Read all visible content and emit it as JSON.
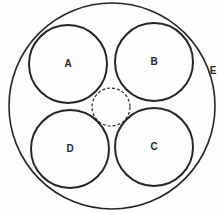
{
  "diagram": {
    "outer": {
      "label": "E",
      "cx": 112,
      "cy": 106,
      "r": 103,
      "label_x": 213,
      "label_y": 71
    },
    "circles": [
      {
        "label": "A",
        "cx": 68,
        "cy": 64,
        "r": 39
      },
      {
        "label": "B",
        "cx": 154,
        "cy": 62,
        "r": 39
      },
      {
        "label": "C",
        "cx": 154,
        "cy": 147,
        "r": 39
      },
      {
        "label": "D",
        "cx": 70,
        "cy": 149,
        "r": 39
      }
    ],
    "center_dashed": {
      "cx": 111,
      "cy": 107,
      "r": 19
    },
    "stroke_color": "#262626"
  }
}
